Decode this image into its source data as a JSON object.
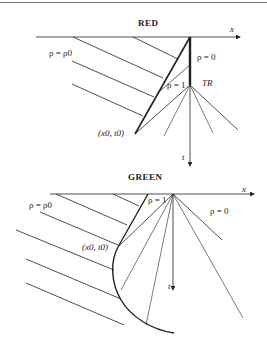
{
  "panels": [
    {
      "title": "RED",
      "axis_x": "x",
      "axis_t": "t",
      "labels": {
        "left_density": "ρ = ρ0",
        "right_density": "ρ = 0",
        "middle_density": "ρ = 1",
        "point": "(x0, t0)",
        "time_point": "TR"
      }
    },
    {
      "title": "GREEN",
      "axis_x": "x",
      "axis_t": "t",
      "labels": {
        "left_density": "ρ = ρ0",
        "right_density": "ρ = 0",
        "middle_density": "ρ = 1",
        "point": "(x0, t0)"
      }
    }
  ],
  "colors": {
    "line": "#222222",
    "border": "#777777"
  }
}
